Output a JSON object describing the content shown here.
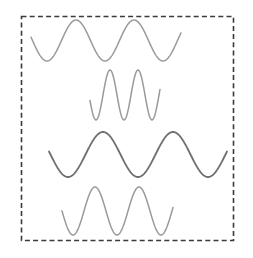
{
  "diagram": {
    "frame": {
      "x": 21.5,
      "y": 16.5,
      "width": 212,
      "height": 224,
      "stroke": "#3a3a3a",
      "stroke_width": 1.6,
      "dash": "5 3.2"
    },
    "waves": [
      {
        "id": "wave-1",
        "label": "wide sine wave, 2 cycles",
        "stroke": "#9a9a9a",
        "stroke_width": 1.5,
        "x_start": 31,
        "x_end": 181,
        "y_center": 40.5,
        "amplitude": 20.5,
        "period": 58,
        "phase_x_of_min": 47
      },
      {
        "id": "wave-2",
        "label": "narrow tall sine wave, 2 cycles",
        "stroke": "#9a9a9a",
        "stroke_width": 1.5,
        "x_start": 90,
        "x_end": 160,
        "y_center": 95,
        "amplitude": 25,
        "period": 28,
        "phase_x_of_min": 96
      },
      {
        "id": "wave-3",
        "label": "wide dark sine wave, 2.5 cycles",
        "stroke": "#707070",
        "stroke_width": 1.8,
        "x_start": 49,
        "x_end": 227,
        "y_center": 154.5,
        "amplitude": 22.5,
        "period": 70,
        "phase_x_of_min": 68
      },
      {
        "id": "wave-4",
        "label": "medium sine wave, 2 cycles",
        "stroke": "#9a9a9a",
        "stroke_width": 1.5,
        "x_start": 62,
        "x_end": 173,
        "y_center": 211,
        "amplitude": 24,
        "period": 44,
        "phase_x_of_min": 73
      }
    ]
  }
}
